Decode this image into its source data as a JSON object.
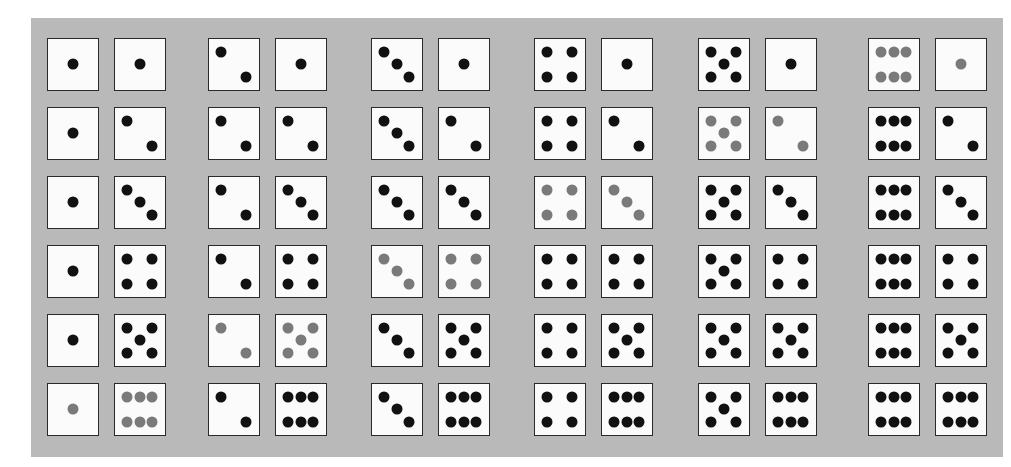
{
  "figure": {
    "panel_color": "#b9b9b9",
    "pip_color": "#111111",
    "highlight_pip_color": "#7a7a7a",
    "highlight_rule": "sum == 7",
    "rows": 6,
    "columns": 6,
    "outcomes": [
      [
        [
          1,
          1
        ],
        [
          1,
          2
        ],
        [
          1,
          3
        ],
        [
          1,
          4
        ],
        [
          1,
          5
        ],
        [
          1,
          6
        ]
      ],
      [
        [
          2,
          1
        ],
        [
          2,
          2
        ],
        [
          2,
          3
        ],
        [
          2,
          4
        ],
        [
          2,
          5
        ],
        [
          2,
          6
        ]
      ],
      [
        [
          3,
          1
        ],
        [
          3,
          2
        ],
        [
          3,
          3
        ],
        [
          3,
          4
        ],
        [
          3,
          5
        ],
        [
          3,
          6
        ]
      ],
      [
        [
          4,
          1
        ],
        [
          4,
          2
        ],
        [
          4,
          3
        ],
        [
          4,
          4
        ],
        [
          4,
          5
        ],
        [
          4,
          6
        ]
      ],
      [
        [
          5,
          1
        ],
        [
          5,
          2
        ],
        [
          5,
          3
        ],
        [
          5,
          4
        ],
        [
          5,
          5
        ],
        [
          5,
          6
        ]
      ],
      [
        [
          6,
          1
        ],
        [
          6,
          2
        ],
        [
          6,
          3
        ],
        [
          6,
          4
        ],
        [
          6,
          5
        ],
        [
          6,
          6
        ]
      ]
    ],
    "highlighted": [
      [
        1,
        6
      ],
      [
        2,
        5
      ],
      [
        3,
        4
      ],
      [
        4,
        3
      ],
      [
        5,
        2
      ],
      [
        6,
        1
      ]
    ]
  },
  "layout": {
    "group_x": [
      47,
      208,
      371,
      534,
      698,
      868
    ],
    "second_die_offset": 67,
    "row_y": [
      38,
      107,
      176,
      245,
      314,
      383
    ]
  }
}
